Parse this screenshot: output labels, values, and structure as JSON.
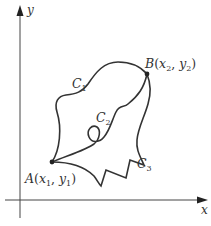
{
  "figure": {
    "axes": {
      "x_label": "x",
      "y_label": "y"
    },
    "points": {
      "A": {
        "name": "A",
        "x_sub": "1",
        "y_sub": "1"
      },
      "B": {
        "name": "B",
        "x_sub": "2",
        "y_sub": "2"
      }
    },
    "curves": [
      {
        "name": "C",
        "sub": "1"
      },
      {
        "name": "C",
        "sub": "2"
      },
      {
        "name": "C",
        "sub": "3"
      }
    ],
    "colors": {
      "stroke": "#333333",
      "background": "#ffffff"
    }
  }
}
